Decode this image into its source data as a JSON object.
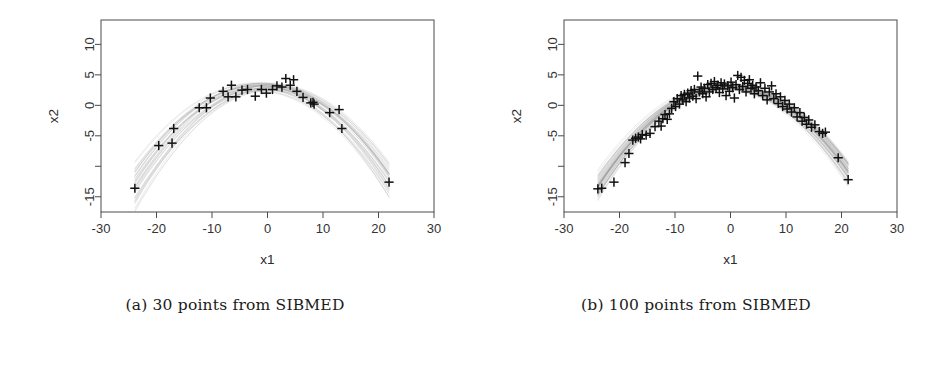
{
  "figure": {
    "kind": "two-panel-scatter-with-curve-band",
    "background": "#ffffff",
    "ink": "#1a1a1a"
  },
  "captions": {
    "a": "(a) 30 points from SIBMED",
    "b": "(b) 100 points from SIBMED"
  },
  "chart_data": [
    {
      "panel": "a",
      "type": "scatter",
      "title": "",
      "xlabel": "x1",
      "ylabel": "x2",
      "xlim": [
        -30,
        30
      ],
      "ylim": [
        -17.5,
        14
      ],
      "xticks": [
        -30,
        -20,
        -10,
        0,
        10,
        20,
        30
      ],
      "xticklabels": [
        "-30",
        "-20",
        "-10",
        "0",
        "10",
        "20",
        "30"
      ],
      "yticks": [
        10,
        5,
        0,
        -5,
        -10,
        -15
      ],
      "yticklabels": [
        "10",
        "5",
        "0",
        "-5",
        "",
        "-15"
      ],
      "grid": false,
      "legend": null,
      "marker": "plus",
      "marker_color": "#111111",
      "band_color": "#9a9a9a",
      "n_points": 30,
      "points": [
        [
          -23.9,
          -13.6
        ],
        [
          -19.6,
          -6.6
        ],
        [
          -17.2,
          -6.2
        ],
        [
          -16.9,
          -3.8
        ],
        [
          -12.3,
          -0.4
        ],
        [
          -11.0,
          -0.4
        ],
        [
          -10.3,
          1.2
        ],
        [
          -8.0,
          2.3
        ],
        [
          -7.1,
          1.4
        ],
        [
          -6.5,
          3.3
        ],
        [
          -5.7,
          1.4
        ],
        [
          -4.6,
          2.5
        ],
        [
          -3.6,
          2.6
        ],
        [
          -2.2,
          1.5
        ],
        [
          -1.1,
          2.6
        ],
        [
          -0.2,
          2.0
        ],
        [
          0.9,
          2.6
        ],
        [
          1.7,
          3.2
        ],
        [
          2.6,
          3.0
        ],
        [
          3.3,
          4.4
        ],
        [
          4.1,
          3.3
        ],
        [
          4.7,
          4.2
        ],
        [
          5.3,
          2.3
        ],
        [
          6.4,
          1.3
        ],
        [
          7.8,
          0.4
        ],
        [
          8.2,
          0.5
        ],
        [
          8.4,
          0.2
        ],
        [
          11.2,
          -1.2
        ],
        [
          12.9,
          -0.7
        ],
        [
          13.4,
          -3.8
        ],
        [
          21.9,
          -12.6
        ]
      ],
      "band_curves": 40,
      "band_note": "overlaid near-parabolic fitted curves forming a gray envelope, pinching to thin tails near x=-21 and x=+22"
    },
    {
      "panel": "b",
      "type": "scatter",
      "title": "",
      "xlabel": "x1",
      "ylabel": "x2",
      "xlim": [
        -30,
        30
      ],
      "ylim": [
        -17.5,
        14
      ],
      "xticks": [
        -30,
        -20,
        -10,
        0,
        10,
        20,
        30
      ],
      "xticklabels": [
        "-30",
        "-20",
        "-10",
        "0",
        "10",
        "20",
        "30"
      ],
      "yticks": [
        10,
        5,
        0,
        -5,
        -10,
        -15
      ],
      "yticklabels": [
        "10",
        "5",
        "0",
        "-5",
        "",
        "-15"
      ],
      "grid": false,
      "legend": null,
      "marker": "plus",
      "marker_color": "#111111",
      "band_color": "#9a9a9a",
      "n_points": 100,
      "points": [
        [
          -23.9,
          -13.7
        ],
        [
          -23.2,
          -13.6
        ],
        [
          -21.0,
          -12.6
        ],
        [
          -19.0,
          -9.4
        ],
        [
          -18.3,
          -7.9
        ],
        [
          -17.6,
          -5.7
        ],
        [
          -17.1,
          -5.4
        ],
        [
          -16.6,
          -5.2
        ],
        [
          -16.2,
          -5.5
        ],
        [
          -15.9,
          -4.8
        ],
        [
          -15.2,
          -4.9
        ],
        [
          -14.5,
          -4.6
        ],
        [
          -13.6,
          -3.5
        ],
        [
          -12.9,
          -2.6
        ],
        [
          -12.5,
          -3.4
        ],
        [
          -12.2,
          -2.2
        ],
        [
          -11.8,
          -1.5
        ],
        [
          -11.4,
          -2.3
        ],
        [
          -11.0,
          -1.4
        ],
        [
          -10.6,
          -0.5
        ],
        [
          -10.2,
          0.6
        ],
        [
          -9.9,
          -0.2
        ],
        [
          -9.6,
          1.1
        ],
        [
          -9.2,
          0.2
        ],
        [
          -8.9,
          1.6
        ],
        [
          -8.6,
          0.9
        ],
        [
          -8.3,
          1.8
        ],
        [
          -8.0,
          0.6
        ],
        [
          -7.7,
          2.0
        ],
        [
          -7.4,
          1.2
        ],
        [
          -7.1,
          2.4
        ],
        [
          -6.8,
          1.5
        ],
        [
          -6.5,
          2.6
        ],
        [
          -6.2,
          1.1
        ],
        [
          -5.9,
          4.8
        ],
        [
          -5.6,
          2.2
        ],
        [
          -5.3,
          3.0
        ],
        [
          -5.0,
          1.9
        ],
        [
          -4.7,
          2.8
        ],
        [
          -4.4,
          1.4
        ],
        [
          -4.1,
          3.4
        ],
        [
          -3.8,
          2.2
        ],
        [
          -3.5,
          3.6
        ],
        [
          -3.2,
          2.6
        ],
        [
          -2.9,
          3.9
        ],
        [
          -2.6,
          2.9
        ],
        [
          -2.3,
          3.3
        ],
        [
          -2.0,
          2.1
        ],
        [
          -1.7,
          3.7
        ],
        [
          -1.4,
          2.7
        ],
        [
          -1.1,
          3.5
        ],
        [
          -0.8,
          1.6
        ],
        [
          -0.5,
          3.2
        ],
        [
          -0.2,
          2.3
        ],
        [
          0.1,
          3.8
        ],
        [
          0.4,
          2.9
        ],
        [
          0.7,
          1.2
        ],
        [
          1.0,
          3.4
        ],
        [
          1.3,
          4.9
        ],
        [
          1.6,
          2.6
        ],
        [
          1.9,
          4.6
        ],
        [
          2.2,
          3.1
        ],
        [
          2.5,
          4.1
        ],
        [
          2.8,
          2.2
        ],
        [
          3.1,
          3.6
        ],
        [
          3.4,
          4.2
        ],
        [
          3.7,
          2.8
        ],
        [
          4.0,
          3.3
        ],
        [
          4.3,
          1.9
        ],
        [
          4.6,
          3.0
        ],
        [
          5.0,
          2.4
        ],
        [
          5.4,
          3.7
        ],
        [
          5.8,
          1.6
        ],
        [
          6.2,
          2.8
        ],
        [
          6.6,
          0.9
        ],
        [
          7.0,
          2.2
        ],
        [
          7.4,
          3.2
        ],
        [
          7.8,
          1.1
        ],
        [
          8.2,
          1.9
        ],
        [
          8.6,
          0.3
        ],
        [
          9.0,
          1.4
        ],
        [
          9.4,
          -0.2
        ],
        [
          9.8,
          0.8
        ],
        [
          10.2,
          -0.6
        ],
        [
          10.6,
          0.2
        ],
        [
          11.0,
          -1.1
        ],
        [
          11.5,
          -0.4
        ],
        [
          12.0,
          -1.9
        ],
        [
          12.5,
          -1.2
        ],
        [
          12.9,
          -2.6
        ],
        [
          13.3,
          -2.0
        ],
        [
          13.7,
          -3.1
        ],
        [
          14.1,
          -2.4
        ],
        [
          14.6,
          -3.6
        ],
        [
          15.2,
          -3.2
        ],
        [
          16.0,
          -4.3
        ],
        [
          16.6,
          -4.6
        ],
        [
          17.1,
          -4.4
        ],
        [
          19.4,
          -8.6
        ],
        [
          21.2,
          -12.2
        ]
      ],
      "band_curves": 60,
      "band_note": "overlaid near-parabolic fitted curves forming a tighter gray envelope than panel (a)"
    }
  ]
}
